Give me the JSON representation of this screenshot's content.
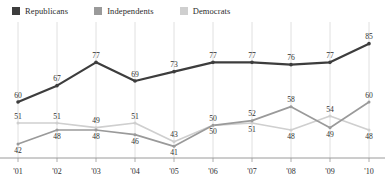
{
  "legend": {
    "items": [
      {
        "label": "Republicans",
        "color": "#3d3d3d",
        "icon": "square-swatch-icon"
      },
      {
        "label": "Independents",
        "color": "#9a9a9a",
        "icon": "square-swatch-icon"
      },
      {
        "label": "Democrats",
        "color": "#cfcfcf",
        "icon": "square-swatch-icon"
      }
    ]
  },
  "chart_data": {
    "type": "line",
    "title": "",
    "subtitle": "",
    "xlabel": "",
    "ylabel": "",
    "grid": "vertical",
    "legend_position": "top-left",
    "categories": [
      "'01",
      "'02",
      "'03",
      "'04",
      "'05",
      "'06",
      "'07",
      "'08",
      "'09",
      "'10"
    ],
    "xlim": [
      0,
      9
    ],
    "ylim": [
      36,
      90
    ],
    "series": [
      {
        "name": "Republicans",
        "color": "#3d3d3d",
        "values": [
          60,
          67,
          77,
          69,
          73,
          77,
          77,
          76,
          77,
          85
        ],
        "labels": [
          "60",
          "67",
          "77",
          "69",
          "73",
          "77",
          "77",
          "76",
          "77",
          "85"
        ],
        "label_side": [
          "above",
          "above",
          "above",
          "above",
          "above",
          "above",
          "above",
          "above",
          "above",
          "above"
        ]
      },
      {
        "name": "Independents",
        "color": "#9a9a9a",
        "values": [
          42,
          48,
          48,
          46,
          41,
          50,
          52,
          58,
          49,
          60
        ],
        "labels": [
          "42",
          "48",
          "48",
          "46",
          "41",
          "50",
          "52",
          "58",
          "49",
          "60"
        ],
        "label_side": [
          "below",
          "below",
          "below",
          "below",
          "below",
          "below",
          "above",
          "above",
          "below",
          "above"
        ]
      },
      {
        "name": "Democrats",
        "color": "#cfcfcf",
        "values": [
          51,
          51,
          49,
          51,
          43,
          50,
          51,
          48,
          54,
          48
        ],
        "labels": [
          "51",
          "51",
          "49",
          "51",
          "43",
          "50",
          "51",
          "48",
          "54",
          "48"
        ],
        "label_side": [
          "above",
          "above",
          "above",
          "above",
          "above",
          "above",
          "below",
          "below",
          "above",
          "below"
        ]
      }
    ],
    "axis": {
      "baseline_color": "#9a9a9a",
      "gridline_color": "#d8d8d8",
      "tick_labels": [
        "'01",
        "'02",
        "'03",
        "'04",
        "'05",
        "'06",
        "'07",
        "'08",
        "'09",
        "'10"
      ]
    }
  }
}
